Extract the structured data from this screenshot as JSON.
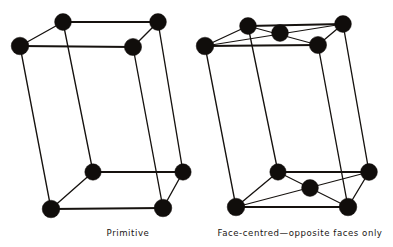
{
  "figure": {
    "background_color": "#ffffff",
    "line_color": "#16120f",
    "atom_color": "#100d0b",
    "atom_radius_px": 8,
    "width_px": 393,
    "height_px": 247
  },
  "panels": [
    {
      "id": "primitive",
      "caption": "Primitive",
      "caption_position": {
        "x": 128,
        "y": 236
      },
      "atom_count": 8,
      "description_atoms": "corner atoms only",
      "atoms": [
        {
          "name": "top-back-left",
          "x": 63,
          "y": 22
        },
        {
          "name": "top-back-right",
          "x": 158,
          "y": 22
        },
        {
          "name": "top-front-left",
          "x": 20,
          "y": 46
        },
        {
          "name": "top-front-right",
          "x": 133,
          "y": 47
        },
        {
          "name": "bottom-back-left",
          "x": 93,
          "y": 172
        },
        {
          "name": "bottom-back-right",
          "x": 183,
          "y": 172
        },
        {
          "name": "bottom-front-left",
          "x": 51,
          "y": 209
        },
        {
          "name": "bottom-front-right",
          "x": 163,
          "y": 208
        }
      ],
      "edges": [
        {
          "from": "top-back-left",
          "to": "top-back-right"
        },
        {
          "from": "top-back-left",
          "to": "top-front-left"
        },
        {
          "from": "top-front-left",
          "to": "top-front-right"
        },
        {
          "from": "top-front-right",
          "to": "top-back-right"
        },
        {
          "from": "bottom-back-left",
          "to": "bottom-back-right"
        },
        {
          "from": "bottom-back-left",
          "to": "bottom-front-left"
        },
        {
          "from": "bottom-front-left",
          "to": "bottom-front-right"
        },
        {
          "from": "bottom-front-right",
          "to": "bottom-back-right"
        },
        {
          "from": "top-back-left",
          "to": "bottom-back-left"
        },
        {
          "from": "top-back-right",
          "to": "bottom-back-right"
        },
        {
          "from": "top-front-left",
          "to": "bottom-front-left"
        },
        {
          "from": "top-front-right",
          "to": "bottom-front-right"
        }
      ],
      "face_diagonals": []
    },
    {
      "id": "face-centred-opposite-faces",
      "caption": "Face-centred—opposite faces only",
      "caption_position": {
        "x": 300,
        "y": 236
      },
      "atom_count": 10,
      "description_atoms": "corner atoms plus one centre atom on top face and one on bottom face",
      "atoms": [
        {
          "name": "top-back-left",
          "x": 248,
          "y": 26
        },
        {
          "name": "top-back-right",
          "x": 343,
          "y": 24
        },
        {
          "name": "top-front-left",
          "x": 205,
          "y": 46
        },
        {
          "name": "top-front-right",
          "x": 318,
          "y": 45
        },
        {
          "name": "top-face-centre",
          "x": 280,
          "y": 33
        },
        {
          "name": "bottom-back-left",
          "x": 278,
          "y": 172
        },
        {
          "name": "bottom-back-right",
          "x": 369,
          "y": 172
        },
        {
          "name": "bottom-front-left",
          "x": 236,
          "y": 207
        },
        {
          "name": "bottom-front-right",
          "x": 348,
          "y": 207
        },
        {
          "name": "bottom-face-centre",
          "x": 310,
          "y": 188
        }
      ],
      "edges": [
        {
          "from": "top-back-left",
          "to": "top-back-right"
        },
        {
          "from": "top-back-left",
          "to": "top-front-left"
        },
        {
          "from": "top-front-left",
          "to": "top-front-right"
        },
        {
          "from": "top-front-right",
          "to": "top-back-right"
        },
        {
          "from": "bottom-back-left",
          "to": "bottom-back-right"
        },
        {
          "from": "bottom-back-left",
          "to": "bottom-front-left"
        },
        {
          "from": "bottom-front-left",
          "to": "bottom-front-right"
        },
        {
          "from": "bottom-front-right",
          "to": "bottom-back-right"
        },
        {
          "from": "top-back-left",
          "to": "bottom-back-left"
        },
        {
          "from": "top-back-right",
          "to": "bottom-back-right"
        },
        {
          "from": "top-front-left",
          "to": "bottom-front-left"
        },
        {
          "from": "top-front-right",
          "to": "bottom-front-right"
        }
      ],
      "face_diagonals": [
        {
          "from": "top-front-left",
          "to": "top-back-right"
        },
        {
          "from": "top-back-left",
          "to": "top-front-right"
        },
        {
          "from": "bottom-front-left",
          "to": "bottom-back-right"
        },
        {
          "from": "bottom-back-left",
          "to": "bottom-front-right"
        }
      ]
    }
  ]
}
